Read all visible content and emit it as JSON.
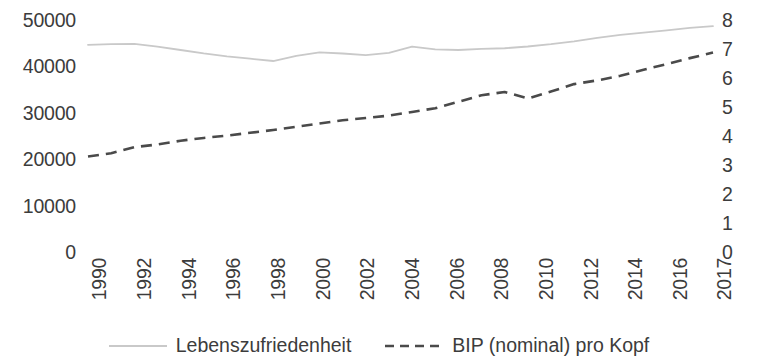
{
  "chart_data": {
    "type": "line",
    "title": "",
    "xlabel": "",
    "ylabel": "",
    "grid": false,
    "legend_position": "bottom",
    "x": [
      1990,
      1991,
      1992,
      1993,
      1994,
      1995,
      1996,
      1997,
      1998,
      1999,
      2000,
      2001,
      2002,
      2003,
      2004,
      2005,
      2006,
      2007,
      2008,
      2009,
      2010,
      2011,
      2012,
      2013,
      2014,
      2015,
      2016,
      2017
    ],
    "x_tick_labels": [
      "1990",
      "1992",
      "1994",
      "1996",
      "1998",
      "2000",
      "2002",
      "2004",
      "2006",
      "2008",
      "2010",
      "2012",
      "2014",
      "2016",
      "2017"
    ],
    "left_axis": {
      "ticks": [
        "50000",
        "40000",
        "30000",
        "20000",
        "10000",
        "0"
      ],
      "values": [
        50000,
        40000,
        30000,
        20000,
        10000,
        0
      ],
      "ylim": [
        0,
        50000
      ]
    },
    "right_axis": {
      "ticks": [
        "8",
        "7",
        "6",
        "5",
        "4",
        "3",
        "2",
        "1",
        "0"
      ],
      "values": [
        8,
        7,
        6,
        5,
        4,
        3,
        2,
        1,
        0
      ],
      "ylim": [
        0,
        8
      ]
    },
    "series": [
      {
        "name": "Lebenszufriedenheit",
        "axis": "right",
        "style": "solid",
        "color": "#c9c9c9",
        "values": [
          7.18,
          7.2,
          7.21,
          7.12,
          7.0,
          6.88,
          6.78,
          6.7,
          6.62,
          6.8,
          6.92,
          6.88,
          6.82,
          6.9,
          7.12,
          7.02,
          7.0,
          7.04,
          7.06,
          7.12,
          7.2,
          7.3,
          7.42,
          7.52,
          7.6,
          7.68,
          7.76,
          7.82
        ]
      },
      {
        "name": "BIP (nominal) pro Kopf",
        "axis": "left",
        "style": "dashed",
        "color": "#4a4a4a",
        "values": [
          20800,
          21500,
          22800,
          23400,
          24200,
          24800,
          25300,
          25900,
          26500,
          27200,
          27900,
          28600,
          29100,
          29600,
          30400,
          31200,
          32600,
          34000,
          34700,
          33300,
          34800,
          36400,
          37200,
          38200,
          39500,
          40700,
          42000,
          43200
        ]
      }
    ]
  },
  "legend": {
    "items": [
      {
        "label": "Lebenszufriedenheit",
        "marker": "solid-line-icon"
      },
      {
        "label": "BIP (nominal) pro Kopf",
        "marker": "dashed-line-icon"
      }
    ]
  },
  "colors": {
    "series_solid": "#c9c9c9",
    "series_dashed": "#4a4a4a",
    "text": "#3c3c3c",
    "background": "#ffffff"
  }
}
